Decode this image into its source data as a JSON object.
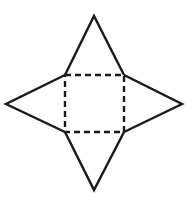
{
  "diagram": {
    "type": "square-pyramid-net",
    "colors": {
      "stroke": "#1a1a1a",
      "background": "#ffffff"
    },
    "base_square": {
      "style": "dashed",
      "corners": {
        "top_left": [
          65,
          75
        ],
        "top_right": [
          124,
          75
        ],
        "bottom_right": [
          124,
          132
        ],
        "bottom_left": [
          65,
          132
        ]
      }
    },
    "triangles": [
      {
        "name": "top",
        "apex": [
          94,
          16
        ]
      },
      {
        "name": "right",
        "apex": [
          182,
          104
        ]
      },
      {
        "name": "bottom",
        "apex": [
          94,
          190
        ]
      },
      {
        "name": "left",
        "apex": [
          6,
          104
        ]
      }
    ],
    "stroke_width": 2.4,
    "dash": "6 4"
  }
}
